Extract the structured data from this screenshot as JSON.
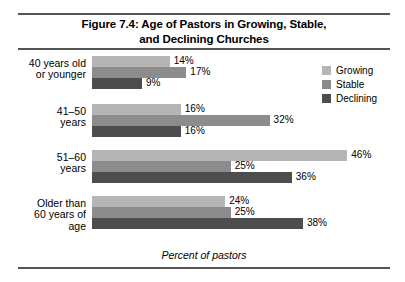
{
  "chart_data": {
    "type": "bar",
    "orientation": "horizontal",
    "title": "Figure 7.4: Age of Pastors in Growing, Stable, and Declining Churches",
    "title_lines": [
      "Figure 7.4: Age of Pastors in Growing, Stable,",
      "and Declining Churches"
    ],
    "xlabel": "Percent of pastors",
    "ylabel": "",
    "xlim": [
      0,
      46
    ],
    "grid": false,
    "legend_position": "top-right",
    "categories": [
      "40 years old or younger",
      "41–50 years",
      "51–60 years",
      "Older than 60 years of age"
    ],
    "category_lines": [
      [
        "40 years old",
        "or younger"
      ],
      [
        "41–50",
        "years"
      ],
      [
        "51–60",
        "years"
      ],
      [
        "Older than",
        "60 years of",
        "age"
      ]
    ],
    "series": [
      {
        "name": "Growing",
        "color": "#b5b5b5",
        "values": [
          14,
          16,
          46,
          24
        ],
        "labels": [
          "14%",
          "16%",
          "46%",
          "24%"
        ]
      },
      {
        "name": "Stable",
        "color": "#8c8c8c",
        "values": [
          17,
          32,
          25,
          25
        ],
        "labels": [
          "17%",
          "32%",
          "25%",
          "25%"
        ]
      },
      {
        "name": "Declining",
        "color": "#4d4d4d",
        "values": [
          9,
          16,
          36,
          38
        ],
        "labels": [
          "9%",
          "16%",
          "36%",
          "38%"
        ]
      }
    ]
  },
  "legend": {
    "items": [
      {
        "label": "Growing",
        "color": "#b5b5b5"
      },
      {
        "label": "Stable",
        "color": "#8c8c8c"
      },
      {
        "label": "Declining",
        "color": "#4d4d4d"
      }
    ]
  }
}
